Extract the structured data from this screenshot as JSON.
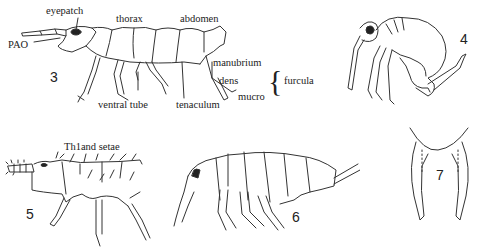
{
  "figure": {
    "panels": [
      {
        "id": "3",
        "label": "3",
        "description": "lateral view of elongate springtail with labelled morphology"
      },
      {
        "id": "4",
        "label": "4",
        "description": "globular springtail (Symphypleona)"
      },
      {
        "id": "5",
        "label": "5",
        "description": "springtail showing Th1 and setae"
      },
      {
        "id": "6",
        "label": "6",
        "description": "springtail with eye patch, lateral view"
      },
      {
        "id": "7",
        "label": "7",
        "description": "furcula dens and mucro detail"
      }
    ],
    "labels": {
      "eyepatch": "eyepatch",
      "thorax": "thorax",
      "abdomen": "abdomen",
      "pao": "PAO",
      "manubrium": "manubrium",
      "dens": "dens",
      "mucro": "mucro",
      "furcula": "furcula",
      "ventral_tube": "ventral tube",
      "tenaculum": "tenaculum",
      "th1_setae": "Th1and setae"
    },
    "brace": "{"
  }
}
